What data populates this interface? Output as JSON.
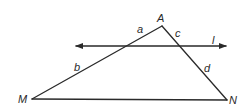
{
  "diagram": {
    "type": "geometry-triangle-with-transversal",
    "vertices": {
      "A": {
        "label": "A",
        "x": 162,
        "y": 26
      },
      "M": {
        "label": "M",
        "x": 32,
        "y": 99
      },
      "N": {
        "label": "N",
        "x": 227,
        "y": 100
      }
    },
    "line": {
      "label": "l",
      "y": 46,
      "x_start": 75,
      "x_end": 226,
      "arrows": "both"
    },
    "segment_labels": {
      "a": "a",
      "b": "b",
      "c": "c",
      "d": "d"
    },
    "colors": {
      "stroke": "#2a2a2a",
      "background": "#ffffff"
    }
  }
}
